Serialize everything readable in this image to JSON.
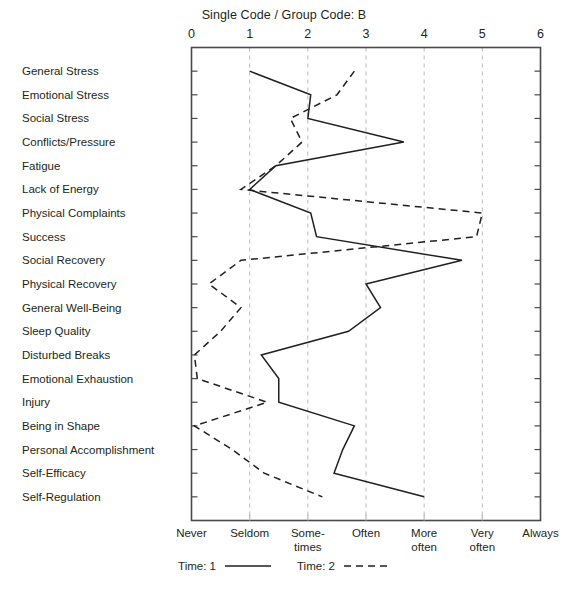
{
  "title": "Single Code / Group Code: B",
  "axis": {
    "x_numbers": [
      "0",
      "1",
      "2",
      "3",
      "4",
      "5",
      "6"
    ],
    "x_categories": [
      "Never",
      "Seldom",
      "Some-\ntimes",
      "Often",
      "More\noften",
      "Very\noften",
      "Always"
    ]
  },
  "legend": {
    "entries": [
      {
        "label": "Time: 1",
        "style": "solid"
      },
      {
        "label": "Time: 2",
        "style": "dashed"
      }
    ]
  },
  "colors": {
    "line": "#231f20",
    "grid": "#b9b9bd",
    "frame": "#4a4a4a",
    "text": "#231f20"
  },
  "chart_data": {
    "type": "line",
    "orientation": "horizontal",
    "title": "Single Code / Group Code: B",
    "xlabel": "",
    "ylabel": "",
    "xlim": [
      0,
      6
    ],
    "grid": true,
    "legend_position": "bottom",
    "x_tick_labels": [
      "Never",
      "Seldom",
      "Some-times",
      "Often",
      "More often",
      "Very often",
      "Always"
    ],
    "x_tick_values": [
      0,
      1,
      2,
      3,
      4,
      5,
      6
    ],
    "categories": [
      "General Stress",
      "Emotional Stress",
      "Social Stress",
      "Conflicts/Pressure",
      "Fatigue",
      "Lack of Energy",
      "Physical Complaints",
      "Success",
      "Social Recovery",
      "Physical Recovery",
      "General Well-Being",
      "Sleep Quality",
      "Disturbed Breaks",
      "Emotional Exhaustion",
      "Injury",
      "Being in Shape",
      "Personal Accomplishment",
      "Self-Efficacy",
      "Self-Regulation"
    ],
    "series": [
      {
        "name": "Time: 1",
        "style": "solid",
        "values": [
          1.0,
          2.05,
          2.0,
          3.65,
          1.45,
          1.0,
          2.05,
          2.15,
          4.65,
          3.0,
          3.25,
          2.7,
          1.2,
          1.5,
          1.5,
          2.8,
          2.6,
          2.45,
          4.0
        ]
      },
      {
        "name": "Time: 2",
        "style": "dashed",
        "values": [
          2.8,
          2.5,
          1.7,
          1.9,
          1.45,
          0.85,
          5.0,
          4.9,
          0.85,
          0.3,
          0.85,
          0.5,
          0.05,
          0.1,
          1.3,
          0.05,
          0.7,
          1.25,
          2.25
        ]
      }
    ]
  }
}
